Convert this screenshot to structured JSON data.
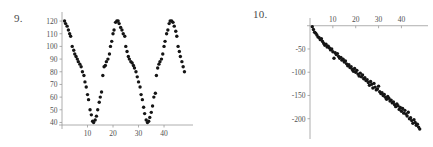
{
  "page": {
    "background_color": "#ffffff",
    "point_color": "#151515",
    "axis_color": "#9a9a9a",
    "label_color": "#4f4f4f"
  },
  "figures": [
    {
      "number_label": "9.",
      "chart_data": {
        "type": "scatter",
        "title": "",
        "xlabel": "",
        "ylabel": "",
        "xlim": [
          0,
          49
        ],
        "ylim": [
          38,
          124
        ],
        "grid": false,
        "legend": null,
        "xticks": [
          10,
          20,
          30,
          40
        ],
        "yticks": [
          40,
          50,
          60,
          70,
          80,
          90,
          100,
          110,
          120
        ],
        "xtick_labels": [
          "10",
          "20",
          "30",
          "40"
        ],
        "ytick_labels": [
          "40",
          "50",
          "60",
          "70",
          "80",
          "90",
          "100",
          "110",
          "120"
        ],
        "description": "Sinusoidal scatter, about three cycles, midline 80, amplitude 40, period 16",
        "x": [
          1,
          1.4,
          2,
          2.5,
          3,
          3.4,
          4,
          4.6,
          5,
          5.5,
          6,
          6.4,
          7,
          7.5,
          8,
          8.6,
          9,
          9.5,
          10,
          10.4,
          11,
          11.5,
          12,
          12.4,
          13,
          13.5,
          14,
          14.6,
          15,
          15.5,
          16,
          16.5,
          17,
          17.4,
          18,
          18.6,
          19,
          19.5,
          20,
          20.4,
          21,
          21.5,
          22,
          22.4,
          23,
          23.5,
          24,
          24.6,
          25,
          25.5,
          26,
          26.4,
          27,
          27.5,
          28,
          28.4,
          29,
          29.5,
          30,
          30.6,
          31,
          31.5,
          32,
          32.4,
          33,
          33.5,
          34,
          34.4,
          35,
          35.5,
          36,
          36.6,
          37,
          37.5,
          38,
          38.4,
          39,
          39.5,
          40,
          40.4,
          41,
          41.5,
          42,
          42.4,
          43,
          43.5,
          44,
          44.6,
          45,
          45.5,
          46,
          46.4,
          47,
          47.5,
          48
        ],
        "y": [
          120,
          118,
          116,
          113,
          110,
          108,
          100,
          97,
          94,
          92,
          90,
          88,
          86,
          84,
          80,
          77,
          72,
          68,
          62,
          58,
          50,
          46,
          41,
          40,
          42,
          45,
          50,
          56,
          60,
          64,
          77,
          84,
          85,
          88,
          90,
          94,
          100,
          104,
          110,
          113,
          119,
          120,
          120,
          118,
          115,
          113,
          110,
          108,
          100,
          96,
          92,
          90,
          88,
          87,
          85,
          83,
          80,
          76,
          72,
          68,
          62,
          58,
          52,
          47,
          42,
          40,
          41,
          44,
          48,
          53,
          60,
          63,
          77,
          83,
          86,
          88,
          90,
          94,
          100,
          104,
          110,
          113,
          118,
          120,
          120,
          119,
          116,
          112,
          108,
          100,
          96,
          92,
          88,
          84,
          80
        ]
      }
    },
    {
      "number_label": "10.",
      "chart_data": {
        "type": "scatter",
        "title": "",
        "xlabel": "",
        "ylabel": "",
        "xlim": [
          0,
          49
        ],
        "ylim": [
          -235,
          8
        ],
        "grid": false,
        "legend": null,
        "xticks": [
          10,
          20,
          30,
          40
        ],
        "yticks": [
          -50,
          -100,
          -150,
          -200
        ],
        "xtick_labels": [
          "10",
          "20",
          "30",
          "40"
        ],
        "ytick_labels": [
          "-50",
          "-100",
          "-150",
          "-200"
        ],
        "xaxis_position": "top",
        "description": "Linear declining scatter with noise, slope about -4.7, intercept about 0",
        "x": [
          1,
          1.5,
          2,
          2.5,
          3,
          3.5,
          4,
          4.5,
          5,
          5.5,
          6,
          6.5,
          7,
          7.5,
          8,
          8.5,
          9,
          9.5,
          10,
          10.5,
          11,
          11.5,
          12,
          12.5,
          13,
          13.5,
          14,
          14.5,
          15,
          15.5,
          16,
          16.5,
          17,
          17.5,
          18,
          18.5,
          19,
          19.5,
          20,
          20.5,
          21,
          21.5,
          22,
          22.5,
          23,
          23.5,
          24,
          24.5,
          25,
          25.5,
          26,
          26.5,
          27,
          27.5,
          28,
          28.5,
          29,
          29.5,
          30,
          30.5,
          31,
          31.5,
          32,
          32.5,
          33,
          33.5,
          34,
          34.5,
          35,
          35.5,
          36,
          36.5,
          37,
          37.5,
          38,
          38.5,
          39,
          39.5,
          40,
          40.5,
          41,
          41.5,
          42,
          42.5,
          43,
          43.5,
          44,
          44.5,
          45,
          45.5,
          46,
          46.5,
          47,
          47.5,
          48
        ],
        "y": [
          -2,
          -8,
          -14,
          -16,
          -20,
          -24,
          -26,
          -30,
          -28,
          -34,
          -38,
          -42,
          -40,
          -46,
          -44,
          -48,
          -52,
          -50,
          -56,
          -70,
          -58,
          -62,
          -60,
          -66,
          -70,
          -68,
          -74,
          -72,
          -78,
          -76,
          -82,
          -86,
          -84,
          -90,
          -88,
          -94,
          -98,
          -92,
          -100,
          -96,
          -104,
          -108,
          -102,
          -110,
          -106,
          -114,
          -112,
          -118,
          -116,
          -122,
          -128,
          -120,
          -126,
          -134,
          -124,
          -132,
          -138,
          -136,
          -130,
          -142,
          -146,
          -144,
          -150,
          -148,
          -154,
          -158,
          -152,
          -156,
          -162,
          -160,
          -166,
          -164,
          -170,
          -174,
          -168,
          -172,
          -180,
          -176,
          -184,
          -178,
          -188,
          -182,
          -190,
          -194,
          -186,
          -200,
          -198,
          -204,
          -210,
          -202,
          -208,
          -214,
          -212,
          -218,
          -222
        ]
      }
    }
  ]
}
